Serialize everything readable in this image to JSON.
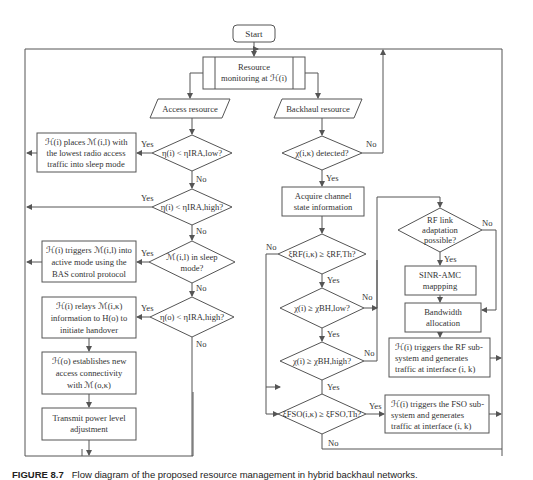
{
  "nodes": {
    "start": "Start",
    "monitor": [
      "Resource",
      "monitoring at ℋ(i)"
    ],
    "access": "Access resource",
    "backhaul": "Backhaul resource",
    "d_low": "η(i) < ηIRA,low?",
    "p_sleep": [
      "ℋ(i) places ℳ(i,l) with",
      "the lowest radio access",
      "traffic into sleep mode"
    ],
    "d_high": "η(i) < ηIRA,high?",
    "d_sleep": [
      "ℳ(i,l) in sleep",
      "mode?"
    ],
    "p_active": [
      "ℋ(i) triggers ℳ(i,l) into",
      "active mode using the",
      "BAS control protocol"
    ],
    "d_high2": "η(o) < ηIRA,high?",
    "p_relay": [
      "ℋ(i) relays ℳ(i,κ)",
      "information to H(o) to",
      "initiate handover"
    ],
    "p_establish": [
      "ℋ(o) establishes new",
      "access connectivity",
      "with ℳ(o,κ)"
    ],
    "p_power": [
      "Transmit power level",
      "adjustment"
    ],
    "d_detect": "χ(i,κ) detected?",
    "p_acquire": [
      "Acquire channel",
      "state information"
    ],
    "d_rf": "ξRF(i,κ) ≥ ξRF,Th?",
    "d_bhlow": "χ(i) ≥ χBH,low?",
    "d_bhhigh": "χ(i) ≥ χBH,high?",
    "d_fso": "ξFSO(i,κ) ≥ ξFSO,Th?",
    "d_rflink": [
      "RF link",
      "adaptation",
      "possible?"
    ],
    "p_sinr": [
      "SINR-AMC",
      "mappping"
    ],
    "p_bw": [
      "Bandwidth",
      "allocation"
    ],
    "p_rf_trigger": [
      "ℋ(i) triggers the RF sub-",
      "system and generates",
      "traffic at interface (i, k)"
    ],
    "p_fso_trigger": [
      "ℋ(i) triggers the FSO sub-",
      "system and generates",
      "traffic at interface (i, k)"
    ]
  },
  "labels": {
    "yes": "Yes",
    "no": "No"
  },
  "caption": {
    "number": "FIGURE 8.7",
    "text": "Flow diagram of the proposed resource management in hybrid backhaul networks."
  }
}
